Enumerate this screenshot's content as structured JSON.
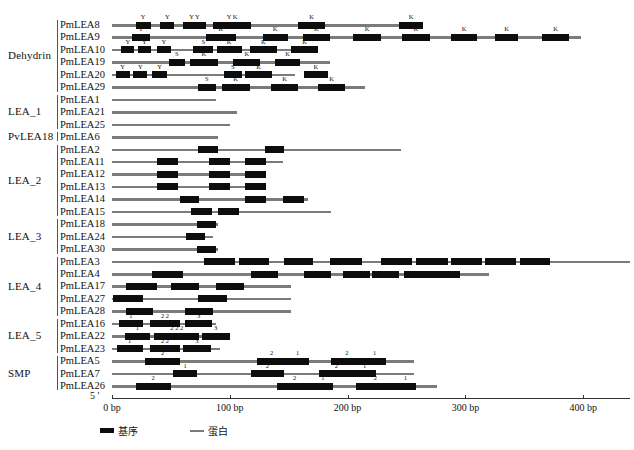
{
  "figure": {
    "title": "",
    "axis": {
      "start_label": "5 '",
      "end_label": "3 '",
      "unit": "bp",
      "ticks": [
        {
          "value": 0,
          "label": "0 bp"
        },
        {
          "value": 100,
          "label": "100 bp"
        },
        {
          "value": 200,
          "label": "200 bp"
        },
        {
          "value": 300,
          "label": "300 bp"
        },
        {
          "value": 400,
          "label": "400 bp"
        }
      ],
      "range": [
        0,
        440
      ],
      "px_per_bp": 1.178,
      "origin_px": 112
    },
    "legend": [
      {
        "key": "motif",
        "label": "基序",
        "color": "#0d0d0d",
        "shape": "thick-bar"
      },
      {
        "key": "protein",
        "label": "蛋白",
        "color": "#7b7b7b",
        "shape": "thin-line"
      }
    ],
    "families": [
      {
        "name": "Dehydrin",
        "first_row": 0,
        "count": 6
      },
      {
        "name": "LEA_1",
        "first_row": 6,
        "count": 3
      },
      {
        "name": "PvLEA18",
        "first_row": 9,
        "count": 1
      },
      {
        "name": "LEA_2",
        "first_row": 10,
        "count": 6
      },
      {
        "name": "LEA_3",
        "first_row": 16,
        "count": 3
      },
      {
        "name": "LEA_4",
        "first_row": 19,
        "count": 5
      },
      {
        "name": "LEA_5",
        "first_row": 24,
        "count": 3
      },
      {
        "name": "SMP",
        "first_row": 27,
        "count": 3
      }
    ]
  },
  "chart_data": {
    "type": "table",
    "title": "",
    "xlabel": "bp",
    "ylabel": "",
    "xlim": [
      0,
      440
    ],
    "legend_position": "bottom-left",
    "grid": false,
    "categories": [
      "PmLEA8",
      "PmLEA9",
      "PmLEA10",
      "PmLEA19",
      "PmLEA20",
      "PmLEA29",
      "PmLEA1",
      "PmLEA21",
      "PmLEA25",
      "PmLEA6",
      "PmLEA2",
      "PmLEA11",
      "PmLEA12",
      "PmLEA13",
      "PmLEA14",
      "PmLEA15",
      "PmLEA18",
      "PmLEA24",
      "PmLEA30",
      "PmLEA3",
      "PmLEA4",
      "PmLEA17",
      "PmLEA27",
      "PmLEA28",
      "PmLEA16",
      "PmLEA22",
      "PmLEA23",
      "PmLEA5",
      "PmLEA7",
      "PmLEA26"
    ],
    "rows": [
      {
        "name": "PmLEA8",
        "family": "Dehydrin",
        "length": 264,
        "motifs": [
          {
            "start": 20,
            "end": 33,
            "label": "Y"
          },
          {
            "start": 41,
            "end": 53,
            "label": "Y"
          },
          {
            "start": 60,
            "end": 80,
            "label": "Y Y"
          },
          {
            "start": 86,
            "end": 118,
            "label": "Y K"
          },
          {
            "start": 158,
            "end": 181,
            "label": "K"
          },
          {
            "start": 244,
            "end": 264,
            "label": "K"
          }
        ]
      },
      {
        "name": "PmLEA9",
        "family": "Dehydrin",
        "length": 398,
        "motifs": [
          {
            "start": 17,
            "end": 32,
            "label": "Y"
          },
          {
            "start": 80,
            "end": 105,
            "label": "K"
          },
          {
            "start": 128,
            "end": 149,
            "label": "K"
          },
          {
            "start": 162,
            "end": 185,
            "label": "K"
          },
          {
            "start": 205,
            "end": 228,
            "label": "K"
          },
          {
            "start": 246,
            "end": 270,
            "label": "K"
          },
          {
            "start": 288,
            "end": 310,
            "label": "K"
          },
          {
            "start": 325,
            "end": 345,
            "label": "K"
          },
          {
            "start": 365,
            "end": 388,
            "label": "K"
          }
        ]
      },
      {
        "name": "PmLEA10",
        "family": "Dehydrin",
        "length": 155,
        "motifs": [
          {
            "start": 8,
            "end": 19,
            "label": "Y"
          },
          {
            "start": 22,
            "end": 33,
            "label": "Y"
          },
          {
            "start": 38,
            "end": 50,
            "label": "Y"
          },
          {
            "start": 69,
            "end": 86,
            "label": "S"
          },
          {
            "start": 89,
            "end": 110,
            "label": "K"
          },
          {
            "start": 117,
            "end": 140,
            "label": "K"
          },
          {
            "start": 152,
            "end": 175,
            "label": "K"
          }
        ]
      },
      {
        "name": "PmLEA19",
        "family": "Dehydrin",
        "length": 185,
        "motifs": [
          {
            "start": 48,
            "end": 62,
            "label": "S"
          },
          {
            "start": 66,
            "end": 90,
            "label": "K"
          },
          {
            "start": 103,
            "end": 126,
            "label": "K"
          },
          {
            "start": 138,
            "end": 160,
            "label": "K"
          }
        ]
      },
      {
        "name": "PmLEA20",
        "family": "Dehydrin",
        "length": 155,
        "motifs": [
          {
            "start": 3,
            "end": 15,
            "label": "Y"
          },
          {
            "start": 18,
            "end": 30,
            "label": "Y"
          },
          {
            "start": 34,
            "end": 47,
            "label": "Y"
          },
          {
            "start": 95,
            "end": 110,
            "label": "S"
          },
          {
            "start": 113,
            "end": 136,
            "label": "K"
          },
          {
            "start": 163,
            "end": 183,
            "label": "K"
          }
        ]
      },
      {
        "name": "PmLEA29",
        "family": "Dehydrin",
        "length": 215,
        "motifs": [
          {
            "start": 73,
            "end": 88,
            "label": "S"
          },
          {
            "start": 93,
            "end": 117,
            "label": "K"
          },
          {
            "start": 135,
            "end": 158,
            "label": "K"
          },
          {
            "start": 175,
            "end": 198,
            "label": "K"
          }
        ]
      },
      {
        "name": "PmLEA1",
        "family": "LEA_1",
        "length": 88,
        "motifs": []
      },
      {
        "name": "PmLEA21",
        "family": "LEA_1",
        "length": 106,
        "motifs": []
      },
      {
        "name": "PmLEA25",
        "family": "LEA_1",
        "length": 100,
        "motifs": []
      },
      {
        "name": "PmLEA6",
        "family": "PvLEA18",
        "length": 90,
        "motifs": []
      },
      {
        "name": "PmLEA2",
        "family": "LEA_2",
        "length": 245,
        "motifs": [
          {
            "start": 73,
            "end": 90,
            "label": ""
          },
          {
            "start": 130,
            "end": 146,
            "label": ""
          }
        ]
      },
      {
        "name": "PmLEA11",
        "family": "LEA_2",
        "length": 145,
        "motifs": [
          {
            "start": 38,
            "end": 56,
            "label": ""
          },
          {
            "start": 82,
            "end": 100,
            "label": ""
          },
          {
            "start": 113,
            "end": 131,
            "label": ""
          }
        ]
      },
      {
        "name": "PmLEA12",
        "family": "LEA_2",
        "length": 125,
        "motifs": [
          {
            "start": 38,
            "end": 56,
            "label": ""
          },
          {
            "start": 82,
            "end": 100,
            "label": ""
          },
          {
            "start": 113,
            "end": 131,
            "label": ""
          }
        ]
      },
      {
        "name": "PmLEA13",
        "family": "LEA_2",
        "length": 128,
        "motifs": [
          {
            "start": 38,
            "end": 56,
            "label": ""
          },
          {
            "start": 82,
            "end": 100,
            "label": ""
          },
          {
            "start": 113,
            "end": 131,
            "label": ""
          }
        ]
      },
      {
        "name": "PmLEA14",
        "family": "LEA_2",
        "length": 166,
        "motifs": [
          {
            "start": 58,
            "end": 74,
            "label": ""
          },
          {
            "start": 113,
            "end": 131,
            "label": ""
          },
          {
            "start": 145,
            "end": 163,
            "label": ""
          }
        ]
      },
      {
        "name": "PmLEA15",
        "family": "LEA_2",
        "length": 186,
        "motifs": [
          {
            "start": 67,
            "end": 85,
            "label": ""
          },
          {
            "start": 90,
            "end": 108,
            "label": ""
          }
        ]
      },
      {
        "name": "PmLEA18",
        "family": "LEA_3",
        "length": 90,
        "motifs": [
          {
            "start": 72,
            "end": 88,
            "label": ""
          }
        ]
      },
      {
        "name": "PmLEA24",
        "family": "LEA_3",
        "length": 86,
        "motifs": [
          {
            "start": 63,
            "end": 79,
            "label": ""
          }
        ]
      },
      {
        "name": "PmLEA30",
        "family": "LEA_3",
        "length": 90,
        "motifs": [
          {
            "start": 72,
            "end": 88,
            "label": ""
          }
        ]
      },
      {
        "name": "PmLEA3",
        "family": "LEA_4",
        "length": 440,
        "motifs": [
          {
            "start": 78,
            "end": 104,
            "label": ""
          },
          {
            "start": 108,
            "end": 133,
            "label": ""
          },
          {
            "start": 146,
            "end": 171,
            "label": ""
          },
          {
            "start": 185,
            "end": 212,
            "label": ""
          },
          {
            "start": 228,
            "end": 255,
            "label": ""
          },
          {
            "start": 258,
            "end": 285,
            "label": ""
          },
          {
            "start": 288,
            "end": 314,
            "label": ""
          },
          {
            "start": 317,
            "end": 343,
            "label": ""
          },
          {
            "start": 346,
            "end": 372,
            "label": ""
          }
        ]
      },
      {
        "name": "PmLEA4",
        "family": "LEA_4",
        "length": 320,
        "motifs": [
          {
            "start": 34,
            "end": 60,
            "label": ""
          },
          {
            "start": 118,
            "end": 141,
            "label": ""
          },
          {
            "start": 163,
            "end": 186,
            "label": ""
          },
          {
            "start": 196,
            "end": 219,
            "label": ""
          },
          {
            "start": 221,
            "end": 244,
            "label": ""
          },
          {
            "start": 248,
            "end": 295,
            "label": ""
          }
        ]
      },
      {
        "name": "PmLEA17",
        "family": "LEA_4",
        "length": 152,
        "motifs": [
          {
            "start": 12,
            "end": 38,
            "label": ""
          },
          {
            "start": 50,
            "end": 74,
            "label": ""
          },
          {
            "start": 88,
            "end": 112,
            "label": ""
          }
        ]
      },
      {
        "name": "PmLEA27",
        "family": "LEA_4",
        "length": 152,
        "motifs": [
          {
            "start": 1,
            "end": 26,
            "label": ""
          },
          {
            "start": 73,
            "end": 98,
            "label": ""
          }
        ]
      },
      {
        "name": "PmLEA28",
        "family": "LEA_4",
        "length": 152,
        "motifs": [
          {
            "start": 12,
            "end": 35,
            "label": ""
          },
          {
            "start": 62,
            "end": 86,
            "label": ""
          }
        ]
      },
      {
        "name": "PmLEA16",
        "family": "LEA_5",
        "length": 88,
        "motifs": [
          {
            "start": 6,
            "end": 26,
            "label": "1"
          },
          {
            "start": 32,
            "end": 58,
            "label": "2    2"
          },
          {
            "start": 62,
            "end": 85,
            "label": "3"
          }
        ]
      },
      {
        "name": "PmLEA22",
        "family": "LEA_5",
        "length": 100,
        "motifs": [
          {
            "start": 11,
            "end": 32,
            "label": "1"
          },
          {
            "start": 36,
            "end": 74,
            "label": "2   2   2"
          },
          {
            "start": 76,
            "end": 100,
            "label": "3"
          }
        ]
      },
      {
        "name": "PmLEA23",
        "family": "LEA_5",
        "length": 92,
        "motifs": [
          {
            "start": 4,
            "end": 26,
            "label": "1"
          },
          {
            "start": 32,
            "end": 58,
            "label": "2   2"
          },
          {
            "start": 60,
            "end": 84,
            "label": "3"
          }
        ]
      },
      {
        "name": "PmLEA5",
        "family": "SMP",
        "length": 256,
        "motifs": [
          {
            "start": 28,
            "end": 58,
            "label": "2"
          },
          {
            "start": 123,
            "end": 148,
            "label": "2"
          },
          {
            "start": 148,
            "end": 167,
            "label": "1"
          },
          {
            "start": 186,
            "end": 213,
            "label": "2"
          },
          {
            "start": 213,
            "end": 233,
            "label": "1"
          }
        ]
      },
      {
        "name": "PmLEA7",
        "family": "SMP",
        "length": 256,
        "motifs": [
          {
            "start": 52,
            "end": 72,
            "label": "1"
          },
          {
            "start": 118,
            "end": 146,
            "label": "2"
          },
          {
            "start": 176,
            "end": 205,
            "label": "2"
          },
          {
            "start": 205,
            "end": 224,
            "label": "1"
          }
        ]
      },
      {
        "name": "PmLEA26",
        "family": "SMP",
        "length": 276,
        "motifs": [
          {
            "start": 20,
            "end": 50,
            "label": "2"
          },
          {
            "start": 140,
            "end": 170,
            "label": "2"
          },
          {
            "start": 170,
            "end": 188,
            "label": "1"
          },
          {
            "start": 207,
            "end": 240,
            "label": "2"
          },
          {
            "start": 240,
            "end": 258,
            "label": "1"
          }
        ]
      }
    ]
  }
}
